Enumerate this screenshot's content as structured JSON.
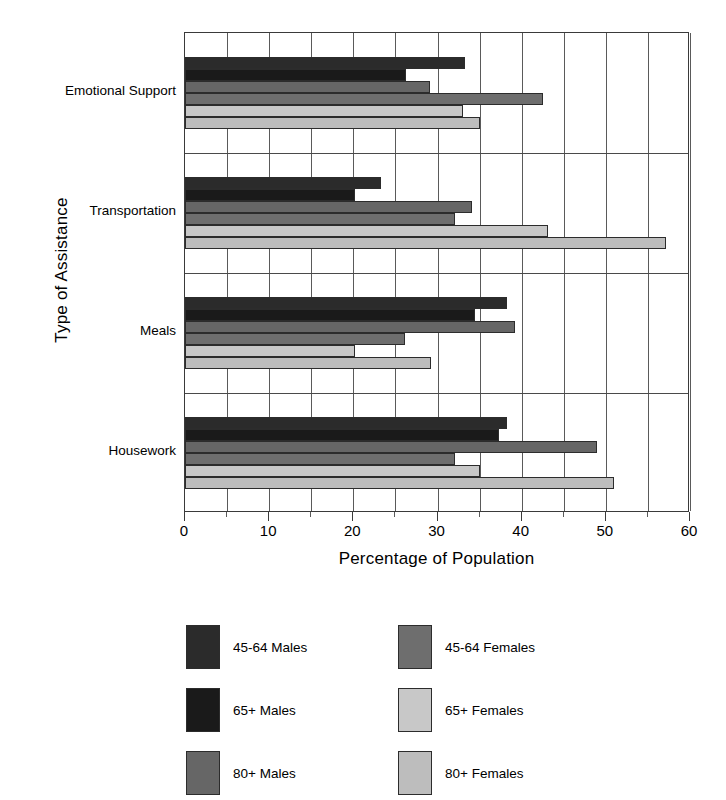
{
  "chart_data": {
    "type": "bar",
    "orientation": "horizontal",
    "title": "",
    "xlabel": "Percentage of Population",
    "ylabel": "Type of Assistance",
    "categories": [
      "Emotional Support",
      "Transportation",
      "Meals",
      "Housework"
    ],
    "xlim": [
      0,
      60
    ],
    "xticks": [
      0,
      10,
      20,
      30,
      40,
      50,
      60
    ],
    "xtick_labels": [
      "0",
      "10",
      "20",
      "30",
      "40",
      "50",
      "60"
    ],
    "minor_xticks": [
      5,
      15,
      25,
      35,
      45,
      55
    ],
    "grid": "vertical-major-and-minor",
    "legend_position": "below-plot-two-columns",
    "series": [
      {
        "name": "45-64 Males",
        "color": "#2b2b2b",
        "values": [
          33.3,
          23.3,
          38.3,
          38.3
        ]
      },
      {
        "name": "65+ Males",
        "color": "#1a1a1a",
        "values": [
          26.3,
          20.2,
          34.4,
          37.3
        ]
      },
      {
        "name": "80+ Males",
        "color": "#666666",
        "values": [
          29.1,
          34.1,
          39.2,
          49.0
        ]
      },
      {
        "name": "45-64 Females",
        "color": "#6e6e6e",
        "values": [
          42.5,
          32.1,
          26.1,
          32.1
        ]
      },
      {
        "name": "65+ Females",
        "color": "#c8c8c8",
        "values": [
          33.0,
          43.1,
          20.2,
          35.1
        ]
      },
      {
        "name": "80+ Females",
        "color": "#bdbdbd",
        "values": [
          35.1,
          57.2,
          29.2,
          51.0
        ]
      }
    ]
  },
  "legend": {
    "items": [
      {
        "label": "45-64 Males",
        "color": "#2b2b2b",
        "column": "left",
        "row": 0
      },
      {
        "label": "65+ Males",
        "color": "#1a1a1a",
        "column": "left",
        "row": 1
      },
      {
        "label": "80+ Males",
        "color": "#666666",
        "column": "left",
        "row": 2
      },
      {
        "label": "45-64 Females",
        "color": "#6e6e6e",
        "column": "right",
        "row": 0
      },
      {
        "label": "65+ Females",
        "color": "#c8c8c8",
        "column": "right",
        "row": 1
      },
      {
        "label": "80+ Females",
        "color": "#bdbdbd",
        "column": "right",
        "row": 2
      }
    ]
  },
  "colors": {
    "axis": "#3a3a3a",
    "gridline": "#5a5a5a",
    "bar_outline": "#2c2c2c",
    "background": "#ffffff",
    "text": "#000000"
  }
}
